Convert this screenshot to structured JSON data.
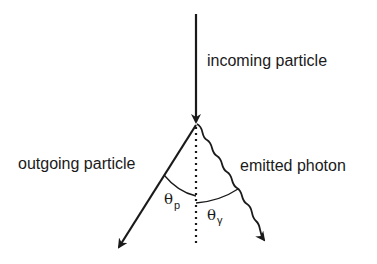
{
  "diagram": {
    "labels": {
      "incoming": "incoming particle",
      "outgoing": "outgoing particle",
      "photon": "emitted photon"
    },
    "angles": {
      "theta_p": {
        "symbol": "θ",
        "subscript": "p"
      },
      "theta_gamma": {
        "symbol": "θ",
        "subscript": "γ"
      }
    },
    "colors": {
      "stroke": "#1a1a1a",
      "background": "#ffffff"
    }
  }
}
